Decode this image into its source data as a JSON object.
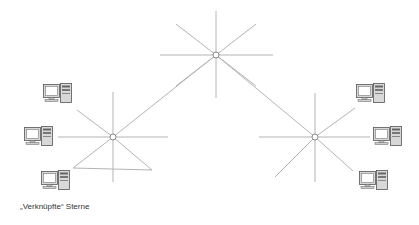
{
  "caption": "„Verknüpfte“ Sterne",
  "colors": {
    "line": "#b4b4b4",
    "hub_stroke": "#8a8a8a",
    "hub_fill": "#ffffff",
    "computer_stroke": "#555555",
    "computer_fill": "#d8d8d8",
    "screen_fill": "#ffffff",
    "caption": "#333333"
  },
  "hubs": [
    {
      "id": "hub-center",
      "x": 216,
      "y": 55
    },
    {
      "id": "hub-left",
      "x": 113,
      "y": 137
    },
    {
      "id": "hub-right",
      "x": 315,
      "y": 137
    }
  ],
  "links": [
    {
      "from": "hub-left",
      "to": "hub-center"
    },
    {
      "from": "hub-center",
      "to": "hub-right"
    }
  ],
  "computers": [
    {
      "id": "pc-left-top",
      "x": 43,
      "y": 83
    },
    {
      "id": "pc-left-middle",
      "x": 24,
      "y": 126
    },
    {
      "id": "pc-left-bottom",
      "x": 41,
      "y": 170
    },
    {
      "id": "pc-right-top",
      "x": 356,
      "y": 83
    },
    {
      "id": "pc-right-middle",
      "x": 373,
      "y": 126
    },
    {
      "id": "pc-right-bottom",
      "x": 359,
      "y": 170
    }
  ]
}
